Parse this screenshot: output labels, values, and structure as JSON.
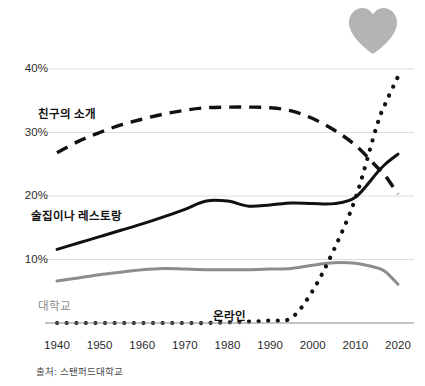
{
  "decoration": {
    "heart_icon": "heart-icon",
    "heart_color": "#b4b4b4"
  },
  "source": {
    "text": "출처: 스탠퍼드대학교"
  },
  "chart_data": {
    "type": "line",
    "title": "",
    "subtitle": "",
    "xlabel": "",
    "ylabel": "",
    "xlim": [
      1940,
      2020
    ],
    "ylim": [
      0,
      40
    ],
    "grid": true,
    "legend_position": "inline-labels",
    "x_ticks": [
      1940,
      1950,
      1960,
      1970,
      1980,
      1990,
      2000,
      2010,
      2020
    ],
    "x_tick_labels": [
      "1940",
      "1950",
      "1960",
      "1970",
      "1980",
      "1990",
      "2000",
      "2010",
      "2020"
    ],
    "y_ticks": [
      10,
      20,
      30,
      40
    ],
    "y_tick_labels": [
      "10%",
      "20%",
      "30%",
      "40%"
    ],
    "x": [
      1940,
      1945,
      1950,
      1955,
      1960,
      1965,
      1970,
      1975,
      1980,
      1985,
      1990,
      1995,
      2000,
      2005,
      2010,
      2015,
      2017,
      2020
    ],
    "series": [
      {
        "name": "친구의 소개",
        "label": "친구의 소개",
        "style": "dashed",
        "color": "#111111",
        "values": [
          26.8,
          28.6,
          30.0,
          31.2,
          32.1,
          32.9,
          33.5,
          33.9,
          34.0,
          34.0,
          33.9,
          33.4,
          32.2,
          30.4,
          28.0,
          24.6,
          23.2,
          20.3
        ]
      },
      {
        "name": "술집이나 레스토랑",
        "label": "술집이나 레스토랑",
        "style": "solid",
        "color": "#111111",
        "values": [
          11.6,
          12.6,
          13.6,
          14.6,
          15.6,
          16.7,
          17.9,
          19.2,
          19.2,
          18.4,
          18.6,
          18.9,
          18.8,
          18.8,
          19.8,
          23.6,
          25.0,
          26.6
        ]
      },
      {
        "name": "대학교",
        "label": "대학교",
        "style": "solid",
        "color": "#8d8d8d",
        "values": [
          6.6,
          7.1,
          7.6,
          8.0,
          8.4,
          8.6,
          8.5,
          8.4,
          8.4,
          8.4,
          8.5,
          8.6,
          9.1,
          9.5,
          9.4,
          8.7,
          8.1,
          6.1
        ]
      },
      {
        "name": "온라인",
        "label": "온라인",
        "style": "dotted",
        "color": "#111111",
        "values": [
          0.0,
          0.0,
          0.0,
          0.0,
          0.0,
          0.0,
          0.0,
          0.0,
          0.1,
          0.2,
          0.4,
          0.8,
          5.1,
          11.6,
          19.6,
          31.0,
          34.5,
          38.8
        ]
      }
    ]
  }
}
